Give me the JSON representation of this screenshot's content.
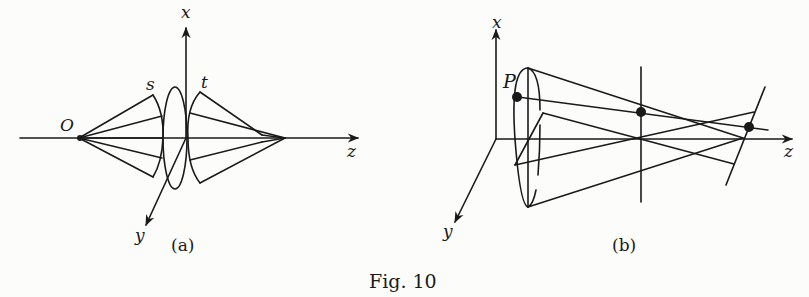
{
  "figure": {
    "caption": "Fig. 10",
    "panel_a": {
      "sublabel": "(a)",
      "axis_labels": {
        "x": "x",
        "y": "y",
        "z": "z"
      },
      "point_labels": {
        "origin": "O",
        "sagittal": "s",
        "tangential": "t"
      }
    },
    "panel_b": {
      "sublabel": "(b)",
      "axis_labels": {
        "x": "x",
        "y": "y",
        "z": "z"
      },
      "point_labels": {
        "point": "P"
      }
    }
  },
  "colors": {
    "ink": "#1a1a1a",
    "paper": "#fcfcfa"
  }
}
